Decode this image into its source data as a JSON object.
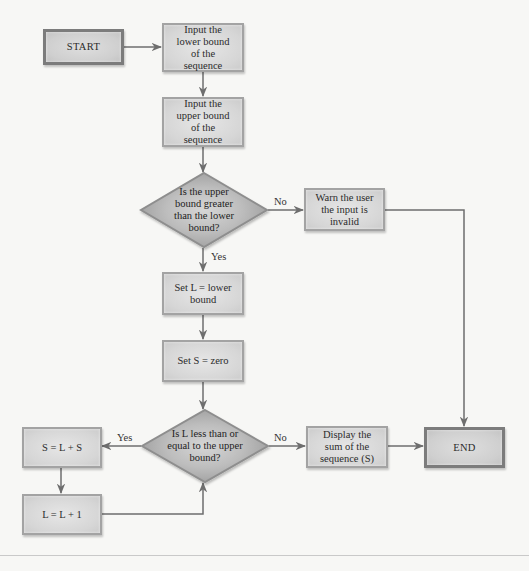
{
  "diagram": {
    "type": "flowchart",
    "colors": {
      "background": "#f7f7f5",
      "box_fill": "#d9d9d9",
      "box_border": "#a3a3a3",
      "terminal_border": "#7c7c7c",
      "decision_fill": "#a9a9a9",
      "decision_center": "#d4d4d4",
      "connector": "#6e6e6e"
    },
    "nodes": {
      "start": {
        "label": "START",
        "shape": "terminal"
      },
      "input_lower": {
        "label": "Input the lower bound of the sequence",
        "shape": "process"
      },
      "input_upper": {
        "label": "Input the upper bound of the sequence",
        "shape": "process"
      },
      "check_bounds": {
        "label": "Is the upper bound greater than the lower bound?",
        "shape": "decision"
      },
      "warn": {
        "label": "Warn the user the input is invalid",
        "shape": "process"
      },
      "set_l": {
        "label": "Set L = lower bound",
        "shape": "process"
      },
      "set_s": {
        "label": "Set S = zero",
        "shape": "process"
      },
      "check_l": {
        "label": "Is L less than or equal to the upper bound?",
        "shape": "decision"
      },
      "sum": {
        "label": "S = L + S",
        "shape": "process"
      },
      "increment": {
        "label": "L = L + 1",
        "shape": "process"
      },
      "display": {
        "label": "Display the sum of the sequence (S)",
        "shape": "process"
      },
      "end": {
        "label": "END",
        "shape": "terminal"
      }
    },
    "edge_labels": {
      "bounds_no": "No",
      "bounds_yes": "Yes",
      "l_yes": "Yes",
      "l_no": "No"
    },
    "edges": [
      {
        "from": "start",
        "to": "input_lower"
      },
      {
        "from": "input_lower",
        "to": "input_upper"
      },
      {
        "from": "input_upper",
        "to": "check_bounds"
      },
      {
        "from": "check_bounds",
        "to": "warn",
        "label": "No"
      },
      {
        "from": "check_bounds",
        "to": "set_l",
        "label": "Yes"
      },
      {
        "from": "warn",
        "to": "end"
      },
      {
        "from": "set_l",
        "to": "set_s"
      },
      {
        "from": "set_s",
        "to": "check_l"
      },
      {
        "from": "check_l",
        "to": "sum",
        "label": "Yes"
      },
      {
        "from": "check_l",
        "to": "display",
        "label": "No"
      },
      {
        "from": "sum",
        "to": "increment"
      },
      {
        "from": "increment",
        "to": "check_l"
      },
      {
        "from": "display",
        "to": "end"
      }
    ]
  }
}
